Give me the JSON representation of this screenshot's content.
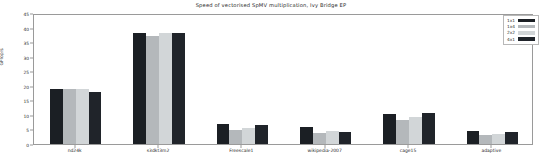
{
  "chart_data": {
    "type": "bar",
    "title": "Speed of vectorised SpMV multiplication, Ivy Bridge EP",
    "xlabel": "",
    "ylabel": "GFlop/s",
    "ylim": [
      0,
      45
    ],
    "yticks": [
      0,
      5,
      10,
      15,
      20,
      25,
      30,
      35,
      40,
      45
    ],
    "ytick_labels": [
      "0",
      "5",
      "10",
      "15",
      "20",
      "25",
      "30",
      "35",
      "40",
      "45"
    ],
    "grid": false,
    "legend_position": "upper right",
    "categories": [
      "nd24k",
      "s3dkt3m2",
      "Freescale1",
      "wikipedia-2007",
      "cage15",
      "adaptive"
    ],
    "series": [
      {
        "name": "1x1",
        "color": "#1b1f24",
        "values": [
          19.0,
          38.2,
          7.0,
          6.0,
          10.3,
          4.6
        ]
      },
      {
        "name": "1x4",
        "color": "#b4b8bb",
        "values": [
          19.0,
          37.2,
          4.8,
          3.8,
          8.2,
          3.0
        ]
      },
      {
        "name": "2x2",
        "color": "#d2d6d8",
        "values": [
          19.0,
          38.0,
          5.6,
          4.6,
          9.4,
          3.5
        ]
      },
      {
        "name": "4x1",
        "color": "#20242a",
        "values": [
          18.0,
          38.2,
          6.6,
          4.2,
          10.8,
          4.0
        ]
      }
    ]
  },
  "legend": {
    "entries": [
      {
        "label": "1x1"
      },
      {
        "label": "1x4"
      },
      {
        "label": "2x2"
      },
      {
        "label": "4x1"
      }
    ]
  }
}
